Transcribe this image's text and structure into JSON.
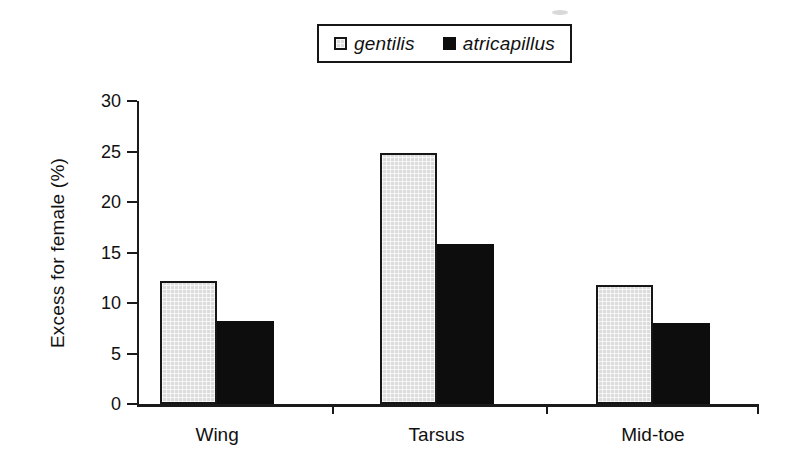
{
  "chart_data": {
    "type": "bar",
    "title": "",
    "categories": [
      "Wing",
      "Tarsus",
      "Mid-toe"
    ],
    "series": [
      {
        "name": "gentilis",
        "values": [
          12.2,
          24.9,
          11.8
        ],
        "color": "#dcdcdc",
        "pattern": "dotted-grid",
        "border_color": "#161616"
      },
      {
        "name": "atricapillus",
        "values": [
          8.2,
          15.8,
          8.0
        ],
        "color": "#0d0d0d",
        "pattern": "solid"
      }
    ],
    "xlabel": "",
    "ylabel": "Excess for female (%)",
    "ylim": [
      0,
      30
    ],
    "yticks": [
      0,
      5,
      10,
      15,
      20,
      25,
      30
    ],
    "legend_position": "top-center",
    "legend_style": "italic, boxed",
    "grid": false,
    "background": "#ffffff",
    "axis_color": "#1a1a1a"
  }
}
